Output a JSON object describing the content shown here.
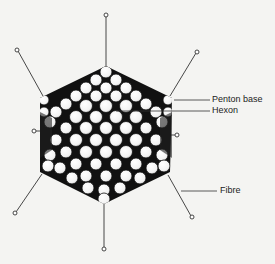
{
  "diagram": {
    "labels": {
      "penton_base": "Penton base",
      "hexon": "Hexon",
      "fibre": "Fibre"
    },
    "colors": {
      "background": "#f4f4f2",
      "capsomere_fill": "#ffffff",
      "outline": "#111111"
    }
  }
}
